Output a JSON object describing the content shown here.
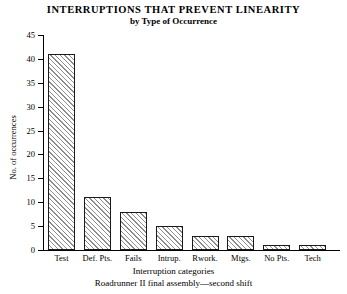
{
  "chart_data": {
    "type": "bar",
    "title": "INTERRUPTIONS THAT PREVENT LINEARITY",
    "subtitle": "by Type of Occurrence",
    "xlabel": "Interruption categories",
    "ylabel": "No. of occurrences",
    "footnote": "Roadrunner II final assembly—second shift",
    "categories": [
      "Test",
      "Def. Pts.",
      "Fails",
      "Intrup.",
      "Rwork.",
      "Mtgs.",
      "No Pts.",
      "Tech"
    ],
    "values": [
      41,
      11,
      8,
      5,
      3,
      3,
      1,
      1
    ],
    "ylim": [
      0,
      45
    ],
    "ytick_step": 5,
    "yticks": [
      0,
      5,
      10,
      15,
      20,
      25,
      30,
      35,
      40,
      45
    ],
    "ytick_labels": [
      "0",
      "5",
      "10",
      "15",
      "20",
      "25",
      "30",
      "35",
      "40",
      "45"
    ],
    "grid": false,
    "legend": null,
    "bar_fill": "#ffffff",
    "bar_hatch": "diagonal",
    "bar_hatch_color": "#8d8d8d",
    "bar_edge_color": "#1a1a1a",
    "background": "#ffffff"
  }
}
